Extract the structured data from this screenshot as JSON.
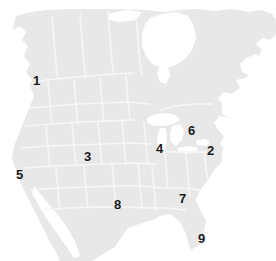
{
  "figure": {
    "name": "north-america-numbered-regions-map",
    "width": 276,
    "height": 261
  },
  "colors": {
    "background": "#ffffff",
    "land_fill": "#e8e8e8",
    "land_fill_alt": "#ececec",
    "border_line": "#f5f5f5",
    "water_fill": "#ffffff",
    "label_text": "#1a1a1a"
  },
  "labels": [
    {
      "id": "label-1",
      "text": "1",
      "x": 33,
      "y": 74
    },
    {
      "id": "label-2",
      "text": "2",
      "x": 207,
      "y": 144
    },
    {
      "id": "label-3",
      "text": "3",
      "x": 84,
      "y": 150
    },
    {
      "id": "label-4",
      "text": "4",
      "x": 156,
      "y": 142
    },
    {
      "id": "label-5",
      "text": "5",
      "x": 16,
      "y": 168
    },
    {
      "id": "label-6",
      "text": "6",
      "x": 188,
      "y": 124
    },
    {
      "id": "label-7",
      "text": "7",
      "x": 179,
      "y": 192
    },
    {
      "id": "label-8",
      "text": "8",
      "x": 114,
      "y": 198
    },
    {
      "id": "label-9",
      "text": "9",
      "x": 198,
      "y": 232
    }
  ]
}
